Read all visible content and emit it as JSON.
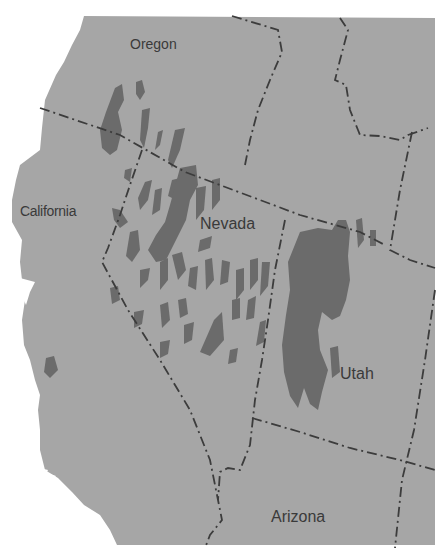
{
  "map": {
    "title": "Great Basin pluvial lakes",
    "colors": {
      "background": "#ffffff",
      "land": "#a6a6a6",
      "lakes": "#6b6b6b",
      "border": "#3c3c3c",
      "label": "#3a3a3a"
    },
    "labels": {
      "oregon": "Oregon",
      "california": "California",
      "nevada": "Nevada",
      "utah": "Utah",
      "arizona": "Arizona"
    },
    "legend": {
      "lakes": "Pluvial lakes (dark gray)",
      "borders": "State boundaries (dash-dot lines)"
    }
  }
}
